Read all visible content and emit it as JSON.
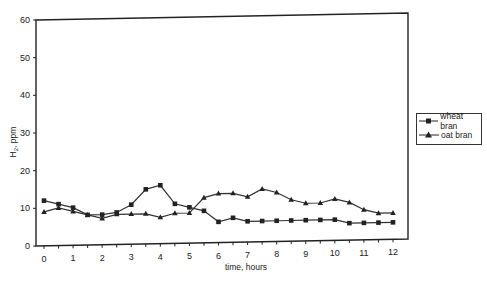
{
  "chart_data": {
    "type": "line",
    "title": "",
    "xlabel": "time, hours",
    "ylabel": "H2, ppm",
    "ylabel_display": {
      "main": "H",
      "sub": "2",
      "rest": ", ppm"
    },
    "xlim": [
      0,
      12
    ],
    "ylim": [
      0,
      60
    ],
    "x_ticks": [
      "0",
      "1",
      "2",
      "3",
      "4",
      "5",
      "6",
      "7",
      "8",
      "9",
      "10",
      "11",
      "12"
    ],
    "y_ticks": [
      "0",
      "10",
      "20",
      "30",
      "40",
      "50",
      "60"
    ],
    "grid": false,
    "legend_position": "right",
    "x": [
      0,
      0.5,
      1,
      1.5,
      2,
      2.5,
      3,
      3.5,
      4,
      4.5,
      5,
      5.5,
      6,
      6.5,
      7,
      7.5,
      8,
      8.5,
      9,
      9.5,
      10,
      10.5,
      11,
      11.5,
      12
    ],
    "series": [
      {
        "name": "wheat bran",
        "marker": "square",
        "values": [
          12,
          11,
          10,
          8,
          8,
          8.5,
          10.5,
          14.5,
          15.5,
          10.5,
          9.5,
          8.5,
          5.5,
          6.5,
          5.5,
          5.5,
          5.5,
          5.5,
          5.5,
          5.5,
          5.5,
          4.5,
          4.5,
          4.5,
          4.5
        ]
      },
      {
        "name": "oat bran",
        "marker": "triangle",
        "values": [
          9,
          10,
          9,
          8,
          7,
          8,
          8,
          8,
          7,
          8,
          8,
          12,
          13,
          13,
          12,
          14,
          13,
          11,
          10,
          10,
          11,
          10,
          8,
          7,
          7
        ]
      }
    ]
  },
  "legend": {
    "items": [
      "wheat bran",
      "oat bran"
    ]
  }
}
